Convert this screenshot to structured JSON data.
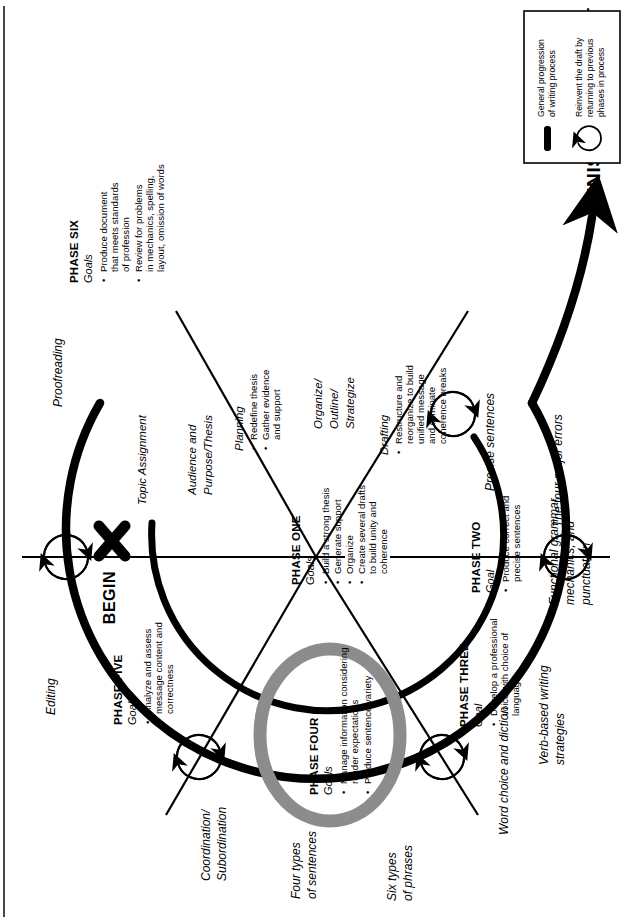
{
  "diagram": {
    "title_hidden": "",
    "begin_label": "BEGIN",
    "finished_label": "FINISHED PRODUCT",
    "colors": {
      "ink": "#000000",
      "phase_four_ring": "#8c8c8c",
      "background": "#ffffff"
    },
    "phases": [
      {
        "id": "phase-one",
        "name": "PHASE ONE",
        "goal_heading": "Goals",
        "bullets": [
          "Build a strong thesis",
          "Generate support",
          "Organize",
          "Create several drafts to build unity and coherence"
        ]
      },
      {
        "id": "phase-two",
        "name": "PHASE TWO",
        "goal_heading": "Goal",
        "bullets": [
          "Produce correct and precise sentences"
        ]
      },
      {
        "id": "phase-three",
        "name": "PHASE THREE",
        "goal_heading": "Goal",
        "bullets": [
          "Develop a professional voice with choice of language"
        ]
      },
      {
        "id": "phase-four",
        "name": "PHASE FOUR",
        "goal_heading": "Goals",
        "bullets": [
          "Manage information considering reader expectations",
          "Produce sentence variety"
        ]
      },
      {
        "id": "phase-five",
        "name": "PHASE FIVE",
        "goal_heading": "Goal",
        "bullets": [
          "Analyze and assess message content and correctness"
        ]
      },
      {
        "id": "phase-six",
        "name": "PHASE SIX",
        "goal_heading": "Goals",
        "bullets": [
          "Produce document that meets standards of profession",
          "Review for problems in mechanics, spelling, layout, omission of words"
        ]
      }
    ],
    "inner_stages": [
      {
        "id": "topic-assignment",
        "label": "Topic Assignment",
        "bullets": []
      },
      {
        "id": "audience-purpose-thesis",
        "label": "Audience and Purpose/Thesis",
        "bullets": []
      },
      {
        "id": "planning",
        "label": "Planning",
        "bullets": [
          "Redefine thesis",
          "Gather evidence and support"
        ]
      },
      {
        "id": "organize-outline-strategize",
        "label": "Organize/ Outline/ Strategize",
        "bullets": []
      },
      {
        "id": "drafting",
        "label": "Drafting",
        "bullets": [
          "Restructure and reorganize to build unified message and eliminate coherence breaks"
        ]
      }
    ],
    "outer_labels": [
      {
        "id": "proofreading",
        "text": "Proofreading"
      },
      {
        "id": "editing",
        "text": "Editing"
      },
      {
        "id": "coordination-subordination",
        "text": "Coordination/ Subordination"
      },
      {
        "id": "four-types-of-sentences",
        "text": "Four types of sentences"
      },
      {
        "id": "six-types-of-phrases",
        "text": "Six types of phrases"
      },
      {
        "id": "word-choice-and-diction",
        "text": "Word choice and diction"
      },
      {
        "id": "verb-based-writing-strategies",
        "text": "Verb-based writing strategies"
      },
      {
        "id": "functional-grammar",
        "text": "Functional grammar, mechanics, and punctuation"
      },
      {
        "id": "the-four-major-errors",
        "text": "The four major errors"
      },
      {
        "id": "precise-sentences",
        "text": "Precise sentences"
      }
    ],
    "legend": {
      "items": [
        {
          "icon": "thick-line-icon",
          "text": "General progression of writing process"
        },
        {
          "icon": "circular-arrow-icon",
          "text": "Reinvent the draft by returning to previous phases in process"
        }
      ]
    }
  }
}
